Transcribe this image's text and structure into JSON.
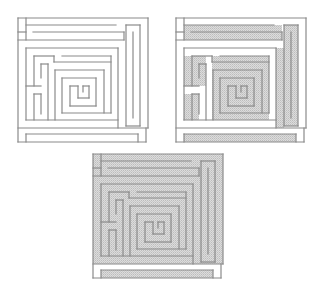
{
  "figure": {
    "panels": [
      {
        "id": "maze-1",
        "position": "top-left",
        "shading": "none"
      },
      {
        "id": "maze-2",
        "position": "top-right",
        "shading": "partial"
      },
      {
        "id": "maze-3",
        "position": "bottom-center",
        "shading": "most"
      }
    ],
    "colors": {
      "wall": "#8a8a8a",
      "shade": "#c8c8c8",
      "background": "#ffffff"
    }
  }
}
